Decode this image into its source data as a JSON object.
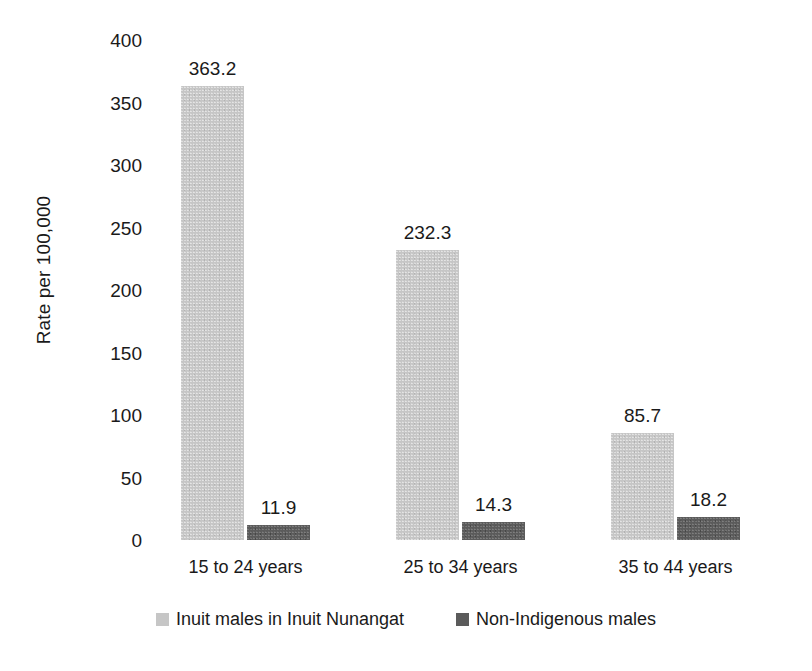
{
  "chart_data": {
    "type": "bar",
    "title": "",
    "subtitle": "",
    "xlabel": "",
    "ylabel": "Rate per 100,000",
    "ylim": [
      0,
      400
    ],
    "ytick_step": 50,
    "yticks": [
      "400",
      "350",
      "300",
      "250",
      "200",
      "150",
      "100",
      "50",
      "0"
    ],
    "ytick_values": [
      400,
      350,
      300,
      250,
      200,
      150,
      100,
      50,
      0
    ],
    "grid": false,
    "axis_lines": false,
    "legend_position": "bottom",
    "categories": [
      "15 to 24 years",
      "25 to 34 years",
      "35 to 44 years"
    ],
    "series": [
      {
        "name": "Inuit males in Inuit Nunangat",
        "color": "#c6c6c6",
        "values": [
          363.2,
          232.3,
          85.7
        ],
        "labels": [
          "363.2",
          "232.3",
          "85.7"
        ]
      },
      {
        "name": "Non-Indigenous males",
        "color": "#5b5b5b",
        "values": [
          11.9,
          14.3,
          18.2
        ],
        "labels": [
          "11.9",
          "14.3",
          "18.2"
        ]
      }
    ]
  },
  "legend": {
    "items": [
      {
        "label": "Inuit males in Inuit Nunangat",
        "swatch": "legend-swatch-series-a"
      },
      {
        "label": "Non-Indigenous males",
        "swatch": "legend-swatch-series-b"
      }
    ]
  },
  "colors": {
    "series_a": "#c6c6c6",
    "series_b": "#5b5b5b",
    "text": "#1a1a1a",
    "background": "#ffffff"
  }
}
